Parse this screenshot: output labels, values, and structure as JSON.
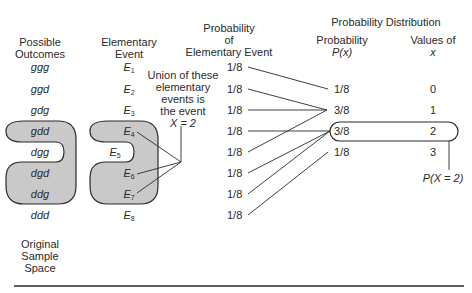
{
  "headers": {
    "outcomes": [
      "Possible",
      "Outcomes"
    ],
    "elementary": [
      "Elementary",
      "Event"
    ],
    "probability_elem": [
      "Probability",
      "of",
      "Elementary Event"
    ],
    "distribution_title": "Probability Distribution",
    "px": [
      "Probability",
      "P(x)"
    ],
    "values": [
      "Values of",
      "x"
    ]
  },
  "rows": [
    {
      "outcome": "ggg",
      "event": "E",
      "sub": "1",
      "prob": "1/8"
    },
    {
      "outcome": "ggd",
      "event": "E",
      "sub": "2",
      "prob": "1/8"
    },
    {
      "outcome": "gdg",
      "event": "E",
      "sub": "3",
      "prob": "1/8"
    },
    {
      "outcome": "gdd",
      "event": "E",
      "sub": "4",
      "prob": "1/8"
    },
    {
      "outcome": "dgg",
      "event": "E",
      "sub": "5",
      "prob": "1/8"
    },
    {
      "outcome": "dgd",
      "event": "E",
      "sub": "6",
      "prob": "1/8"
    },
    {
      "outcome": "ddg",
      "event": "E",
      "sub": "7",
      "prob": "1/8"
    },
    {
      "outcome": "ddd",
      "event": "E",
      "sub": "8",
      "prob": "1/8"
    }
  ],
  "distribution": [
    {
      "p": "1/8",
      "x": "0"
    },
    {
      "p": "3/8",
      "x": "1"
    },
    {
      "p": "3/8",
      "x": "2"
    },
    {
      "p": "1/8",
      "x": "3"
    }
  ],
  "union_note": [
    "Union of these",
    "elementary",
    "events is",
    "the event",
    "X = 2"
  ],
  "px2_label": "P(X = 2)",
  "sample_space_label": [
    "Original",
    "Sample",
    "Space"
  ],
  "colors": {
    "highlight_fill": "#c9c9c9",
    "stroke": "#2a2a2a"
  }
}
